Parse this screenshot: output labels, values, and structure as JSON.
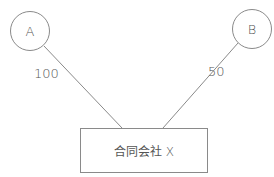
{
  "diagram": {
    "nodes": [
      {
        "id": "A",
        "label": "A",
        "shape": "circle"
      },
      {
        "id": "B",
        "label": "B",
        "shape": "circle"
      },
      {
        "id": "X",
        "label": "合同会社 X",
        "shape": "rectangle"
      }
    ],
    "edges": [
      {
        "from": "A",
        "to": "X",
        "label": "100"
      },
      {
        "from": "B",
        "to": "X",
        "label": "50"
      }
    ],
    "colors": {
      "stroke": "#8a8a8a",
      "text": "#555555",
      "background": "#ffffff"
    }
  }
}
